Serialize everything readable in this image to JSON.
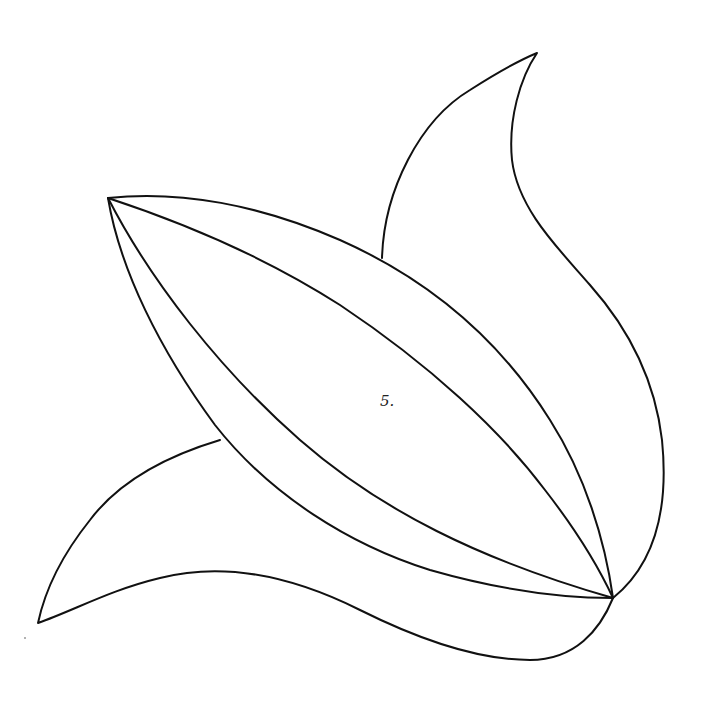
{
  "drawing": {
    "type": "line-art coloring page",
    "subject": "leaf / petal shape",
    "section_label": "5.",
    "colors": {
      "background": "#ffffff",
      "stroke": "#111111"
    }
  }
}
